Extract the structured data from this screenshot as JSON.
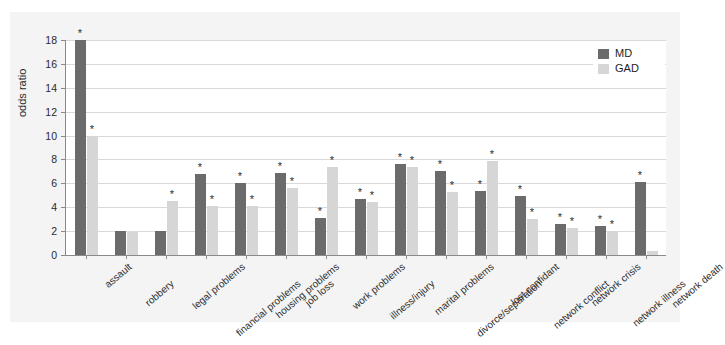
{
  "chart_data": {
    "type": "bar",
    "title": "",
    "xlabel": "",
    "ylabel": "odds ratio",
    "ylim": [
      0,
      18
    ],
    "yticks": [
      0,
      2,
      4,
      6,
      8,
      10,
      12,
      14,
      16,
      18
    ],
    "grid": true,
    "legend_position": "top-right",
    "categories": [
      "assault",
      "robbery",
      "legal problems",
      "financial problems",
      "housing problems",
      "job loss",
      "work problems",
      "illness/injury",
      "marital problems",
      "divorce/separation",
      "lost confidant",
      "network conflict",
      "network crisis",
      "network illness",
      "network death"
    ],
    "series": [
      {
        "name": "MD",
        "color": "#6b6b6b",
        "values": [
          18.0,
          2.0,
          2.0,
          6.8,
          6.0,
          6.9,
          3.1,
          4.7,
          7.6,
          7.0,
          5.4,
          4.9,
          2.6,
          2.4,
          6.1
        ],
        "significant": [
          true,
          false,
          false,
          true,
          true,
          true,
          true,
          true,
          true,
          true,
          true,
          true,
          true,
          true,
          true
        ]
      },
      {
        "name": "GAD",
        "color": "#d6d6d6",
        "values": [
          10.0,
          1.9,
          4.5,
          4.1,
          4.1,
          5.6,
          7.4,
          4.4,
          7.4,
          5.3,
          7.9,
          3.0,
          2.3,
          2.0,
          0.35
        ],
        "significant": [
          true,
          false,
          true,
          true,
          true,
          true,
          true,
          true,
          true,
          true,
          true,
          true,
          true,
          true,
          false
        ]
      }
    ],
    "significance_marker": "*"
  },
  "legend": {
    "items": [
      {
        "label": "MD",
        "color": "#6b6b6b"
      },
      {
        "label": "GAD",
        "color": "#d6d6d6"
      }
    ]
  },
  "axis": {
    "y_title": "odds ratio",
    "y_tick_labels": [
      "0",
      "2",
      "4",
      "6",
      "8",
      "10",
      "12",
      "14",
      "16",
      "18"
    ]
  }
}
